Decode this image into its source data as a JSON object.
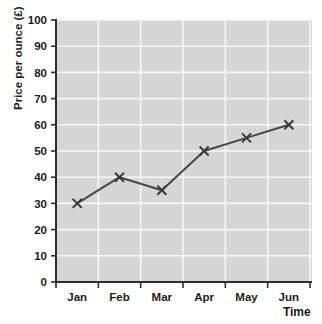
{
  "chart_data": {
    "type": "line",
    "categories": [
      "Jan",
      "Feb",
      "Mar",
      "Apr",
      "May",
      "Jun"
    ],
    "values": [
      30,
      40,
      35,
      50,
      55,
      60
    ],
    "title": "",
    "xlabel": "Time",
    "ylabel": "Price per ounce (£)",
    "ylim": [
      0,
      100
    ],
    "y_tick_step": 10,
    "y_ticks": [
      0,
      10,
      20,
      30,
      40,
      50,
      60,
      70,
      80,
      90,
      100
    ],
    "marker": "x",
    "grid": true,
    "legend": false,
    "colors": {
      "page_bg": "#ffffff",
      "plot_bg": "#d6d6d6",
      "gridline": "#f7f7f7",
      "axis": "#2e2e2e",
      "series_line": "#474747",
      "marker": "#3a3a3a",
      "text": "#1c1c1c"
    }
  }
}
